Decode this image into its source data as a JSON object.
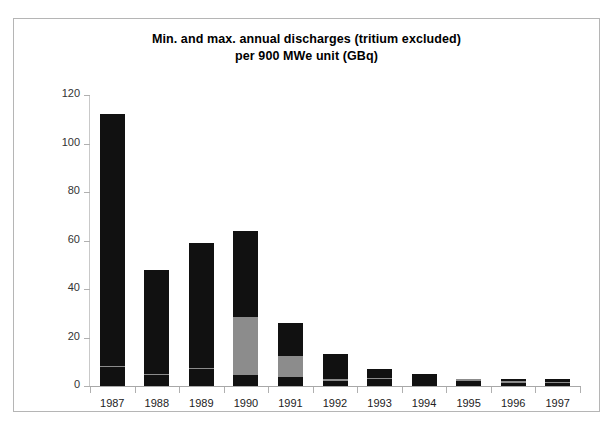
{
  "chart_data": {
    "type": "bar",
    "title": "Min. and max. annual discharges (tritium excluded) per 900 MWe unit (GBq)",
    "title_line1": "Min. and max. annual discharges (tritium excluded)",
    "title_line2": "per 900 MWe unit (GBq)",
    "xlabel": "",
    "ylabel": "",
    "ylim": [
      0,
      120
    ],
    "yticks": [
      0,
      20,
      40,
      60,
      80,
      100,
      120
    ],
    "ytick_labels": [
      "0",
      "20",
      "40",
      "60",
      "80",
      "100",
      "120"
    ],
    "grid": false,
    "legend": "none",
    "categories": [
      "1987",
      "1988",
      "1989",
      "1990",
      "1991",
      "1992",
      "1993",
      "1994",
      "1995",
      "1996",
      "1997"
    ],
    "series": [
      {
        "name": "min",
        "color": "#111111",
        "values": [
          7.8,
          4.6,
          7.0,
          4.6,
          3.8,
          2.2,
          3.0,
          3.4,
          2.2,
          1.4,
          1.3
        ]
      },
      {
        "name": "mid",
        "color": "#8c8c8c",
        "values": [
          0.6,
          0.5,
          0.5,
          24.0,
          8.5,
          0.5,
          0.3,
          0.0,
          0.9,
          0.5,
          0.4
        ]
      },
      {
        "name": "max",
        "color": "#111111",
        "values": [
          103.6,
          42.9,
          51.5,
          35.4,
          13.7,
          10.3,
          3.7,
          1.4,
          0.0,
          1.1,
          1.3
        ]
      }
    ],
    "bar_totals": [
      112.0,
      48.0,
      59.0,
      64.0,
      26.0,
      13.0,
      7.0,
      4.8,
      3.1,
      3.0,
      3.0
    ],
    "colors": {
      "dark": "#111111",
      "gray": "#8c8c8c",
      "background": "#ffffff",
      "frame": "#b5b5b5",
      "axis": "#b0b0b0",
      "text": "#222222"
    }
  }
}
